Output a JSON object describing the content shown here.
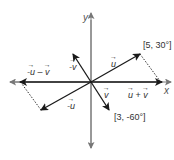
{
  "diagram": {
    "type": "vector-addition",
    "axes": {
      "x_label": "x",
      "y_label": "y"
    },
    "vectors": [
      {
        "name": "u",
        "polar": "[5, 30°]",
        "label": "u"
      },
      {
        "name": "v",
        "polar": "[3, -60°]",
        "label": "v"
      },
      {
        "name": "u+v",
        "label_left": "u",
        "label_op": "+",
        "label_right": "v"
      },
      {
        "name": "-u",
        "label": "-u"
      },
      {
        "name": "-v",
        "label": "-v"
      },
      {
        "name": "-u-v",
        "label_left": "-u",
        "label_op": "–",
        "label_right": "v"
      }
    ],
    "annotations": {
      "u_polar": "[5, 30°]",
      "v_polar": "[3, -60°]"
    },
    "colors": {
      "axis": "#777777",
      "vector": "#1a1a1a",
      "dotted": "#333333",
      "text": "#333333"
    }
  }
}
